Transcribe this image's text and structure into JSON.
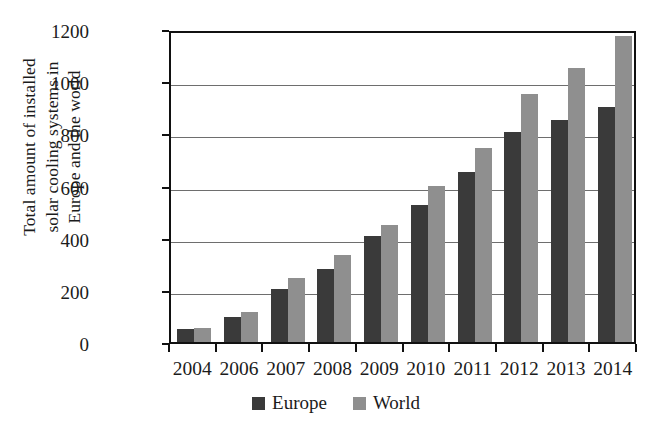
{
  "chart_data": {
    "type": "bar",
    "title": "",
    "xlabel": "",
    "ylabel": "Total amount of installed solar cooling systems in Europe and the world",
    "ylabel_lines": [
      "Total amount of installed",
      "solar cooling systems in",
      "Europe and the world"
    ],
    "categories": [
      "2004",
      "2006",
      "2007",
      "2008",
      "2009",
      "2010",
      "2011",
      "2012",
      "2013",
      "2014"
    ],
    "series": [
      {
        "name": "Europe",
        "color": "#3a3a3a",
        "values": [
          50,
          95,
          205,
          280,
          405,
          525,
          650,
          805,
          850,
          900
        ]
      },
      {
        "name": "World",
        "color": "#8f8f8f",
        "values": [
          55,
          115,
          245,
          335,
          450,
          600,
          745,
          950,
          1050,
          1175
        ]
      }
    ],
    "ylim": [
      0,
      1200
    ],
    "yticks": [
      0,
      200,
      400,
      600,
      800,
      1000,
      1200
    ],
    "ytick_labels": [
      "0",
      "200",
      "400",
      "600",
      "800",
      "1000",
      "1200"
    ],
    "grid": true,
    "grid_axis": "y",
    "legend_position": "bottom-center",
    "legend": [
      "Europe",
      "World"
    ]
  }
}
